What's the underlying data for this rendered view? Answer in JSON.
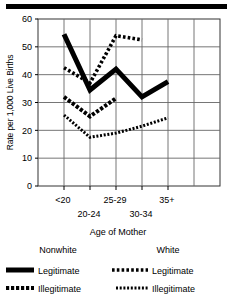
{
  "chart_data": {
    "type": "line",
    "title": "",
    "xlabel": "Age of Mother",
    "ylabel": "Rate per 1,000 Live Births",
    "categories": [
      "<20",
      "20-24",
      "25-29",
      "30-34",
      "35+"
    ],
    "ylim": [
      0,
      60
    ],
    "yticks": [
      0,
      10,
      20,
      30,
      40,
      50,
      60
    ],
    "yticklabels": [
      "0",
      "10",
      "20",
      "30",
      "40",
      "50",
      "60"
    ],
    "grid": true,
    "legend_position": "below",
    "series": [
      {
        "name": "Nonwhite Legitimate",
        "group": "Nonwhite",
        "kind": "Legitimate",
        "style": "thick-solid",
        "color": "#000000",
        "x": [
          "<20",
          "20-24",
          "25-29",
          "30-34",
          "35+"
        ],
        "values": [
          54.5,
          34.5,
          42.0,
          32.0,
          37.5
        ]
      },
      {
        "name": "Nonwhite Illegitimate",
        "group": "Nonwhite",
        "kind": "Illegitimate",
        "style": "thick-dashed",
        "color": "#000000",
        "x": [
          "<20",
          "20-24",
          "25-29"
        ],
        "values": [
          32.0,
          25.0,
          31.5
        ]
      },
      {
        "name": "White Legitimate",
        "group": "White",
        "kind": "Legitimate",
        "style": "square-dotted",
        "color": "#000000",
        "x": [
          "<20",
          "20-24",
          "25-29",
          "30-34"
        ],
        "values": [
          42.5,
          37.0,
          54.0,
          52.5
        ]
      },
      {
        "name": "White Illegitimate",
        "group": "White",
        "kind": "Illegitimate",
        "style": "fine-dotted",
        "color": "#000000",
        "x": [
          "<20",
          "20-24",
          "25-29",
          "30-34",
          "35+"
        ],
        "values": [
          25.5,
          17.5,
          19.0,
          21.5,
          24.5
        ]
      }
    ]
  },
  "axis": {
    "y_title": "Rate per 1,000 Live Births",
    "x_title": "Age of Mother",
    "y_ticks": [
      "60",
      "50",
      "40",
      "30",
      "20",
      "10",
      "0"
    ],
    "x_ticks_upper": [
      "<20",
      "25-29",
      "35+"
    ],
    "x_ticks_lower": [
      "20-24",
      "30-34"
    ]
  },
  "legend": {
    "groups": [
      {
        "header": "Nonwhite",
        "entries": [
          {
            "label": "Legitimate",
            "swatch": "thick-solid"
          },
          {
            "label": "Illegitimate",
            "swatch": "thick-dashed"
          }
        ]
      },
      {
        "header": "White",
        "entries": [
          {
            "label": "Legitimate",
            "swatch": "square-dotted"
          },
          {
            "label": "Illegitimate",
            "swatch": "fine-dotted"
          }
        ]
      }
    ]
  },
  "colors": {
    "ink": "#000000",
    "grid": "#666666",
    "frame": "#333333",
    "background": "#ffffff"
  }
}
